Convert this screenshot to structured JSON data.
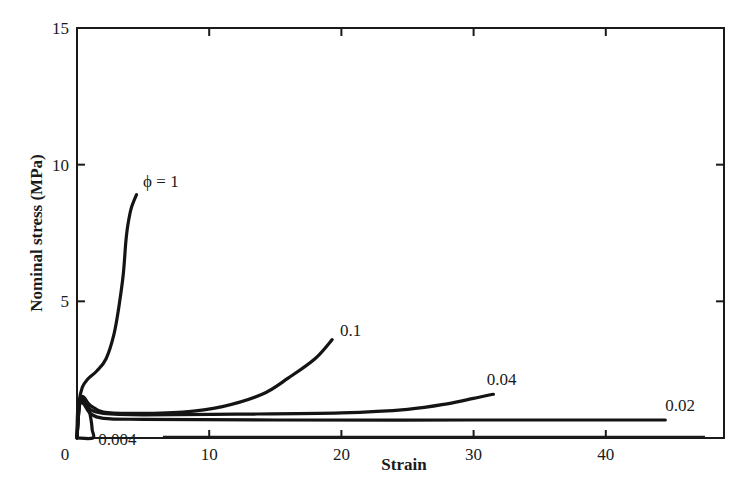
{
  "chart_data": {
    "type": "line",
    "title": "",
    "xlabel": "Strain",
    "ylabel": "Nominal stress (MPa)",
    "xlim": [
      0,
      48.8
    ],
    "ylim": [
      0,
      15
    ],
    "xticks": [
      0,
      10,
      20,
      30,
      40
    ],
    "yticks": [
      0,
      5,
      10,
      15
    ],
    "xtick_labels": [
      "0",
      "10",
      "20",
      "30",
      "40"
    ],
    "ytick_labels": [
      "0",
      "5",
      "10",
      "15"
    ],
    "grid": false,
    "legend": "inline labels at curve ends",
    "series": [
      {
        "name": "φ = 1",
        "label": "ϕ = 1",
        "x": [
          0,
          0.15,
          0.4,
          0.8,
          1.5,
          2.2,
          2.8,
          3.2,
          3.5,
          3.7,
          3.85,
          4.1,
          4.5
        ],
        "y": [
          0,
          1.3,
          1.85,
          2.15,
          2.45,
          2.9,
          3.8,
          4.9,
          6.0,
          7.2,
          7.8,
          8.4,
          8.9
        ],
        "label_pos": [
          5.0,
          9.2
        ]
      },
      {
        "name": "0.1",
        "label": "0.1",
        "x": [
          0,
          0.2,
          0.5,
          1.0,
          2.0,
          4.0,
          8.0,
          11.0,
          14.0,
          16.0,
          18.0,
          19.3
        ],
        "y": [
          0,
          1.3,
          1.45,
          1.2,
          0.95,
          0.9,
          0.95,
          1.15,
          1.6,
          2.2,
          2.9,
          3.6
        ],
        "label_pos": [
          19.9,
          3.75
        ]
      },
      {
        "name": "0.04",
        "label": "0.04",
        "x": [
          0,
          0.2,
          0.5,
          1.0,
          2.0,
          5.0,
          12.0,
          20.0,
          25.0,
          28.0,
          30.0,
          31.5
        ],
        "y": [
          0,
          1.25,
          1.35,
          1.05,
          0.9,
          0.85,
          0.87,
          0.92,
          1.05,
          1.25,
          1.45,
          1.6
        ],
        "label_pos": [
          31.0,
          1.95
        ]
      },
      {
        "name": "0.02",
        "label": "0.02",
        "x": [
          0,
          0.2,
          0.5,
          1.0,
          2.0,
          5.0,
          15.0,
          30.0,
          44.5
        ],
        "y": [
          0,
          1.2,
          1.25,
          0.9,
          0.72,
          0.68,
          0.66,
          0.66,
          0.66
        ],
        "label_pos": [
          44.5,
          1.0
        ]
      },
      {
        "name": "0.004",
        "label": "0.004",
        "x": [
          0,
          0.05,
          0.25,
          0.5,
          0.8,
          1.05,
          1.15,
          1.2,
          0
        ],
        "y": [
          0,
          1.0,
          1.45,
          1.5,
          1.25,
          0.7,
          0.3,
          0,
          0
        ],
        "label_pos": [
          1.6,
          -0.25
        ]
      }
    ]
  }
}
